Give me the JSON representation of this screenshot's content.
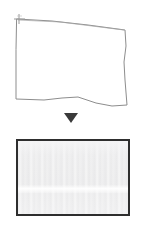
{
  "figure": {
    "title": "Page boundary detection and rectification",
    "background_color": "#ffffff",
    "width": 141,
    "height": 232
  },
  "source_panel": {
    "name": "detected page quadrilateral",
    "stroke_color": "#8a8a8a",
    "fill_color": "#ffffff",
    "stroke_width": "1",
    "outline_points": "17,19 125,30 127,105 16,99",
    "outline_path": "M17,19 L52,21 L88,25 L125,30 L126,58 L124,78 L127,105 L96,103 L70,97 L44,99 L16,99 L16,60 Z",
    "corner_marker": {
      "name": "registration cross",
      "label": "+",
      "x": 19,
      "y": 20,
      "color": "#9a9a9a"
    }
  },
  "flow_arrow": {
    "name": "downward arrow",
    "direction": "down",
    "glyph": "▼",
    "color": "#3a3a3a"
  },
  "output_panel": {
    "name": "rectified output page",
    "border_color": "#2e2e2e",
    "fill_color": "#ececec",
    "highlight_band_color": "#ffffff",
    "border_width": "2"
  }
}
